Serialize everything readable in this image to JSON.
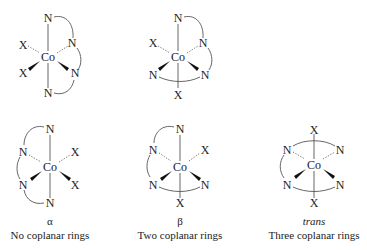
{
  "figure": {
    "structures": [
      {
        "id": "top-left",
        "center": "Co",
        "atoms": {
          "top": "N",
          "upper_left": "X",
          "upper_right": "N",
          "lower_left": "X",
          "lower_right": "N",
          "bottom": "N"
        }
      },
      {
        "id": "top-middle",
        "center": "Co",
        "atoms": {
          "top": "N",
          "upper_left": "X",
          "upper_right": "N",
          "lower_left": "N",
          "lower_right": "N",
          "bottom": "X"
        }
      },
      {
        "id": "alpha",
        "center": "Co",
        "atoms": {
          "top": "N",
          "upper_left": "N",
          "upper_right": "X",
          "lower_left": "N",
          "lower_right": "X",
          "bottom": "N"
        },
        "label": "α",
        "caption": "No coplanar rings"
      },
      {
        "id": "beta",
        "center": "Co",
        "atoms": {
          "top": "N",
          "upper_left": "N",
          "upper_right": "X",
          "lower_left": "N",
          "lower_right": "N",
          "bottom": "X"
        },
        "label": "β",
        "caption": "Two coplanar rings"
      },
      {
        "id": "trans",
        "center": "Co",
        "atoms": {
          "top": "X",
          "upper_left": "N",
          "upper_right": "N",
          "lower_left": "N",
          "lower_right": "N",
          "bottom": "X"
        },
        "label": "trans",
        "caption": "Three coplanar rings"
      }
    ]
  }
}
